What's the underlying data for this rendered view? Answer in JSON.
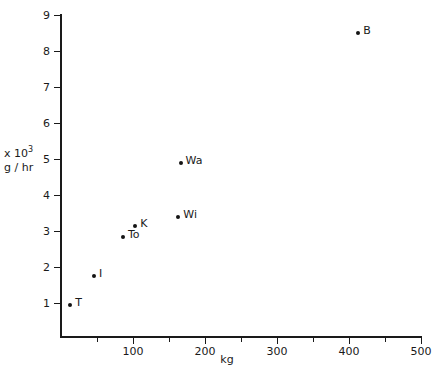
{
  "chart_data": {
    "type": "scatter",
    "title": "",
    "xlabel": "kg",
    "ylabel_line1": "x 10",
    "ylabel_exponent": "3",
    "ylabel_line2": "g / hr",
    "xlim": [
      0,
      500
    ],
    "ylim": [
      0,
      9
    ],
    "grid": false,
    "legend": "none",
    "x_ticks_major": [
      100,
      200,
      300,
      400,
      500
    ],
    "x_ticks_minor": [
      50,
      150,
      250,
      350,
      450
    ],
    "x_tick_labels": [
      "100",
      "200",
      "300",
      "400",
      "500"
    ],
    "y_ticks": [
      1,
      2,
      3,
      4,
      5,
      6,
      7,
      8,
      9
    ],
    "y_tick_labels": [
      "1",
      "2",
      "3",
      "4",
      "5",
      "6",
      "7",
      "8",
      "9"
    ],
    "points": [
      {
        "label": "T",
        "x": 13,
        "y": 0.95,
        "label_pos": "right"
      },
      {
        "label": "I",
        "x": 46,
        "y": 1.75,
        "label_pos": "right"
      },
      {
        "label": "To",
        "x": 86,
        "y": 2.83,
        "label_pos": "right"
      },
      {
        "label": "K",
        "x": 103,
        "y": 3.15,
        "label_pos": "right"
      },
      {
        "label": "Wi",
        "x": 163,
        "y": 3.4,
        "label_pos": "right"
      },
      {
        "label": "Wa",
        "x": 166,
        "y": 4.9,
        "label_pos": "right"
      },
      {
        "label": "B",
        "x": 413,
        "y": 8.5,
        "label_pos": "right"
      }
    ]
  },
  "colors": {
    "axis": "#1a1a1a",
    "marker": "#141414",
    "background": "#ffffff"
  }
}
